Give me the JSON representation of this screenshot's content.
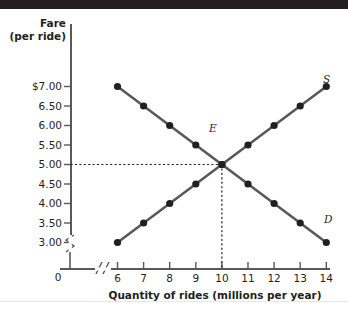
{
  "chart_data": {
    "type": "line",
    "title": "",
    "xlabel": "Quantity of rides (millions per year)",
    "ylabel": "Fare",
    "ylabel_sub": "(per ride)",
    "x": [
      6,
      7,
      8,
      9,
      10,
      11,
      12,
      13,
      14
    ],
    "xticklabels": [
      "6",
      "7",
      "8",
      "9",
      "10",
      "11",
      "12",
      "13",
      "14"
    ],
    "yticklabels": [
      "$7.00",
      "6.50",
      "6.00",
      "5.50",
      "5.00",
      "4.50",
      "4.00",
      "3.50",
      "3.00"
    ],
    "yticks": [
      7.0,
      6.5,
      6.0,
      5.5,
      5.0,
      4.5,
      4.0,
      3.5,
      3.0
    ],
    "origin_label": "0",
    "xlim": [
      6,
      14
    ],
    "ylim": [
      3.0,
      7.0
    ],
    "grid": false,
    "axis_break_x": true,
    "axis_break_y": true,
    "legend_position": "inline-curve-labels",
    "series": [
      {
        "name": "Supply",
        "label": "S",
        "values": [
          3.0,
          3.5,
          4.0,
          4.5,
          5.0,
          5.5,
          6.0,
          6.5,
          7.0
        ]
      },
      {
        "name": "Demand",
        "label": "D",
        "values": [
          7.0,
          6.5,
          6.0,
          5.5,
          5.0,
          4.5,
          4.0,
          3.5,
          3.0
        ]
      }
    ],
    "annotations": [
      {
        "name": "equilibrium",
        "label": "E",
        "x": 10,
        "y": 5.0,
        "guides": "dotted"
      }
    ]
  }
}
